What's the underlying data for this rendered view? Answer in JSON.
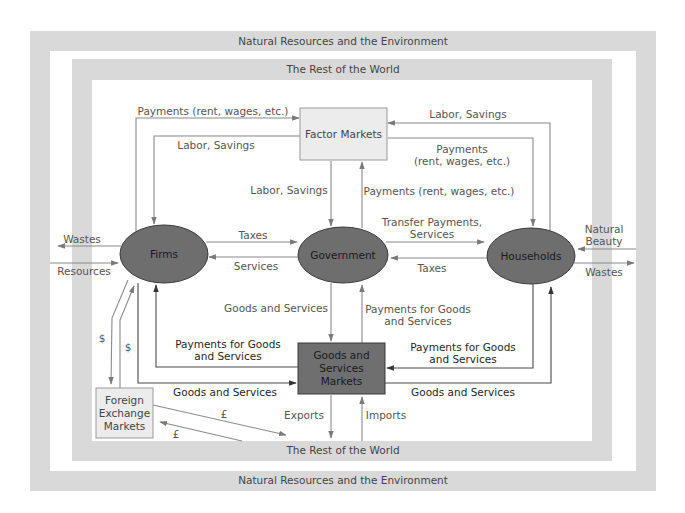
{
  "frames": {
    "outer_label_top": "Natural Resources and the Environment",
    "outer_label_bottom": "Natural Resources and the Environment",
    "inner_label_top": "The Rest of the World",
    "inner_label_bottom": "The Rest of the World"
  },
  "nodes": {
    "factor_markets": "Factor Markets",
    "firms": "Firms",
    "government": "Government",
    "households": "Households",
    "goods_services_markets": [
      "Goods and",
      "Services",
      "Markets"
    ],
    "foreign_exchange_markets": [
      "Foreign",
      "Exchange",
      "Markets"
    ]
  },
  "flows": {
    "firms_to_factor_payments": "Payments (rent, wages, etc.)",
    "factor_to_firms_labor": "Labor, Savings",
    "factor_to_gov_labor": "Labor, Savings",
    "households_to_factor_labor": "Labor, Savings",
    "factor_to_households_payments": [
      "Payments",
      "(rent, wages, etc.)"
    ],
    "gov_to_factor_payments": "Payments (rent, wages, etc.)",
    "firms_to_gov_taxes": "Taxes",
    "gov_to_firms_services": "Services",
    "gov_to_households_transfer": [
      "Transfer Payments,",
      "Services"
    ],
    "households_to_gov_taxes": "Taxes",
    "firms_wastes": "Wastes",
    "firms_resources": "Resources",
    "households_natural_beauty": [
      "Natural",
      "Beauty"
    ],
    "households_wastes": "Wastes",
    "gov_to_goods_markets": "Goods and Services",
    "gov_payments_for_goods": [
      "Payments for Goods",
      "and Services"
    ],
    "markets_to_firms_payments": [
      "Payments for Goods",
      "and Services"
    ],
    "firms_to_markets_goods": "Goods and Services",
    "households_to_markets_payments": [
      "Payments for Goods",
      "and Services"
    ],
    "markets_to_households_goods": "Goods and Services",
    "firms_to_fx_dollar": "$",
    "fx_to_firms_dollar": "$",
    "fx_to_world_pound": "£",
    "world_to_fx_pound": "£",
    "exports": "Exports",
    "imports": "Imports"
  },
  "colors": {
    "band_gray": "#d9d9d9",
    "ellipse_fill": "#6e6e6e",
    "markets_box_fill": "#6f6f6f",
    "light_box_fill": "#ececec",
    "line_color": "#8a8a8a",
    "dark_line": "#555555"
  }
}
